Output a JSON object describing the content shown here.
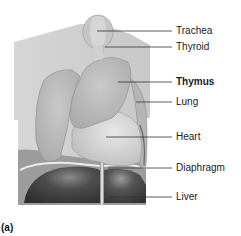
{
  "figure": {
    "panel_letter": "(a)",
    "labels": [
      {
        "text": "Trachea",
        "y": 25,
        "emphasis": false
      },
      {
        "text": "Thyroid",
        "y": 41,
        "emphasis": false
      },
      {
        "text": "Thymus",
        "y": 75,
        "emphasis": true
      },
      {
        "text": "Lung",
        "y": 96,
        "emphasis": false
      },
      {
        "text": "Heart",
        "y": 132,
        "emphasis": false
      },
      {
        "text": "Diaphragm",
        "y": 163,
        "emphasis": false
      },
      {
        "text": "Liver",
        "y": 192,
        "emphasis": false
      }
    ],
    "colors": {
      "background": "#ffffff",
      "torso": "#cfcfcf",
      "organ": "#bdbdbd",
      "liver": "#4a4a4a",
      "leader_line": "#333333",
      "text": "#1a1a1a"
    }
  }
}
